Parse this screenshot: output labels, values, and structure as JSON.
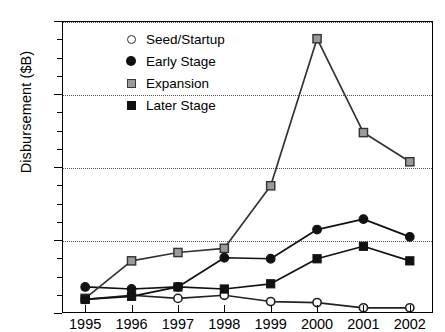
{
  "chart_data": {
    "type": "line",
    "title": "",
    "xlabel": "",
    "ylabel": "Disbursement ($B)",
    "categories": [
      "1995",
      "1996",
      "1997",
      "1998",
      "1999",
      "2000",
      "2001",
      "2002"
    ],
    "x": [
      1995,
      1996,
      1997,
      1998,
      1999,
      2000,
      2001,
      2002
    ],
    "xlim": [
      1995,
      2002
    ],
    "ylim": [
      0,
      2.8
    ],
    "yticks": [
      "0",
      "0.7",
      "1.4",
      "2.1",
      "2.8"
    ],
    "ytick_values": [
      0,
      0.7,
      1.4,
      2.1,
      2.8
    ],
    "yminor_count_between": 3,
    "grid": "horizontal-dotted",
    "legend_position": "upper-left-inside",
    "series": [
      {
        "name": "Seed/Startup",
        "marker": "open-circle",
        "color": "#222222",
        "marker_fill": "#ffffff",
        "values": [
          0.13,
          0.17,
          0.14,
          0.17,
          0.11,
          0.1,
          0.05,
          0.05
        ]
      },
      {
        "name": "Early Stage",
        "marker": "filled-circle",
        "color": "#111111",
        "marker_fill": "#111111",
        "values": [
          0.25,
          0.23,
          0.25,
          0.53,
          0.52,
          0.8,
          0.9,
          0.73
        ]
      },
      {
        "name": "Expansion",
        "marker": "gray-square",
        "color": "#333333",
        "marker_fill": "#9a9a9a",
        "values": [
          0.14,
          0.5,
          0.58,
          0.62,
          1.22,
          2.63,
          1.73,
          1.45
        ]
      },
      {
        "name": "Later Stage",
        "marker": "black-square",
        "color": "#111111",
        "marker_fill": "#111111",
        "values": [
          0.13,
          0.16,
          0.25,
          0.23,
          0.28,
          0.52,
          0.64,
          0.5
        ]
      }
    ]
  }
}
